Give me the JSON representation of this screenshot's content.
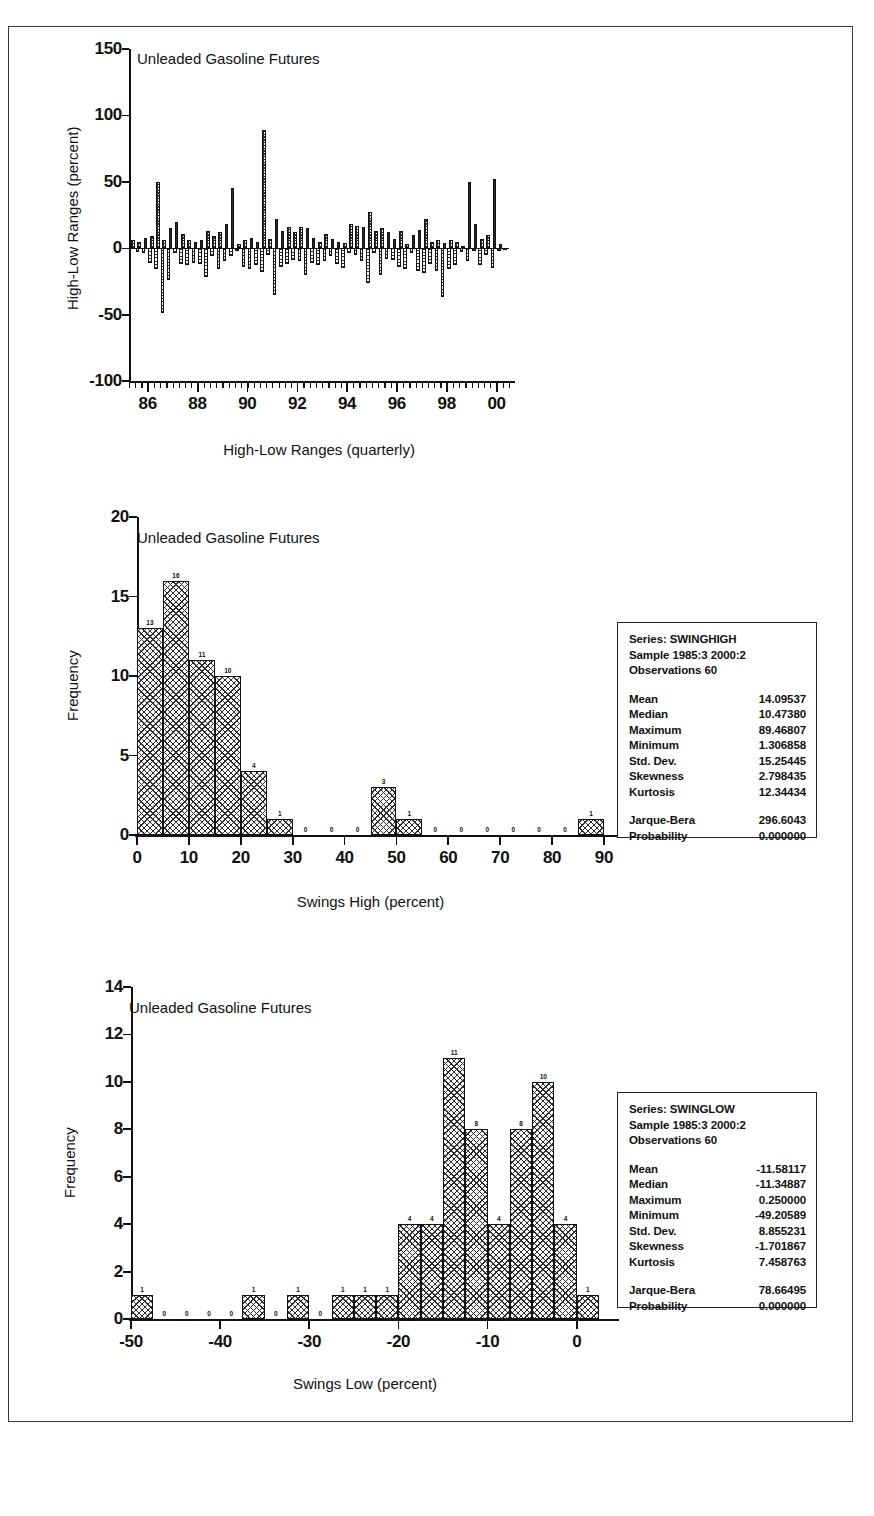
{
  "figure": {
    "border_color": "#3a3a3a",
    "background": "#ffffff"
  },
  "panel1": {
    "title": "Unleaded Gasoline Futures",
    "ylabel": "High-Low Ranges (percent)",
    "xlabel": "High-Low Ranges (quarterly)",
    "yticks": [
      "150",
      "100",
      "50",
      "0",
      "-50",
      "-100"
    ],
    "xticks": [
      "86",
      "88",
      "90",
      "92",
      "94",
      "96",
      "98",
      "00"
    ]
  },
  "panel2": {
    "title": "Unleaded Gasoline Futures",
    "ylabel": "Frequency",
    "xlabel": "Swings High (percent)",
    "yticks": [
      "20",
      "15",
      "10",
      "5",
      "0"
    ],
    "xticks": [
      "0",
      "10",
      "20",
      "30",
      "40",
      "50",
      "60",
      "70",
      "80",
      "90"
    ]
  },
  "panel3": {
    "title": "Unleaded Gasoline Futures",
    "ylabel": "Frequency",
    "xlabel": "Swings Low (percent)",
    "yticks": [
      "14",
      "12",
      "10",
      "8",
      "6",
      "4",
      "2",
      "0"
    ],
    "xticks": [
      "-50",
      "-40",
      "-30",
      "-20",
      "-10",
      "0"
    ]
  },
  "stats_high": {
    "series": "Series: SWINGHIGH",
    "sample": "Sample 1985:3 2000:2",
    "observations": "Observations 60",
    "rows": [
      {
        "key": "Mean",
        "value": "14.09537"
      },
      {
        "key": "Median",
        "value": "10.47380"
      },
      {
        "key": "Maximum",
        "value": "89.46807"
      },
      {
        "key": "Minimum",
        "value": "1.306858"
      },
      {
        "key": "Std. Dev.",
        "value": "15.25445"
      },
      {
        "key": "Skewness",
        "value": "2.798435"
      },
      {
        "key": "Kurtosis",
        "value": "12.34434"
      }
    ],
    "test_rows": [
      {
        "key": "Jarque-Bera",
        "value": "296.6043"
      },
      {
        "key": "Probability",
        "value": "0.000000"
      }
    ]
  },
  "stats_low": {
    "series": "Series: SWINGLOW",
    "sample": "Sample 1985:3 2000:2",
    "observations": "Observations 60",
    "rows": [
      {
        "key": "Mean",
        "value": "-11.58117"
      },
      {
        "key": "Median",
        "value": "-11.34887"
      },
      {
        "key": "Maximum",
        "value": "0.250000"
      },
      {
        "key": "Minimum",
        "value": "-49.20589"
      },
      {
        "key": "Std. Dev.",
        "value": "8.855231"
      },
      {
        "key": "Skewness",
        "value": "-1.701867"
      },
      {
        "key": "Kurtosis",
        "value": "7.458763"
      }
    ],
    "test_rows": [
      {
        "key": "Jarque-Bera",
        "value": "78.66495"
      },
      {
        "key": "Probability",
        "value": "0.000000"
      }
    ]
  },
  "chart_data": [
    {
      "type": "bar",
      "id": "high-low-ranges-quarterly",
      "title": "Unleaded Gasoline Futures",
      "xlabel": "High-Low Ranges (quarterly)",
      "ylabel": "High-Low Ranges (percent)",
      "ylim": [
        -100,
        150
      ],
      "xlim": [
        1985.25,
        2000.5
      ],
      "yticks": [
        -100,
        -50,
        0,
        50,
        100,
        150
      ],
      "xticks": [
        1986,
        1988,
        1990,
        1992,
        1994,
        1996,
        1998,
        2000
      ],
      "xtick_labels": [
        "86",
        "88",
        "90",
        "92",
        "94",
        "96",
        "98",
        "00"
      ],
      "grid": false,
      "legend": "none",
      "note": "Paired quarterly swing-high (positive) and swing-low (negative) percentage bars, 1985:3 through 2000:2",
      "x": [
        1985.5,
        1985.75,
        1986.0,
        1986.25,
        1986.5,
        1986.75,
        1987.0,
        1987.25,
        1987.5,
        1987.75,
        1988.0,
        1988.25,
        1988.5,
        1988.75,
        1989.0,
        1989.25,
        1989.5,
        1989.75,
        1990.0,
        1990.25,
        1990.5,
        1990.75,
        1991.0,
        1991.25,
        1991.5,
        1991.75,
        1992.0,
        1992.25,
        1992.5,
        1992.75,
        1993.0,
        1993.25,
        1993.5,
        1993.75,
        1994.0,
        1994.25,
        1994.5,
        1994.75,
        1995.0,
        1995.25,
        1995.5,
        1995.75,
        1996.0,
        1996.25,
        1996.5,
        1996.75,
        1997.0,
        1997.25,
        1997.5,
        1997.75,
        1998.0,
        1998.25,
        1998.5,
        1998.75,
        1999.0,
        1999.25,
        1999.5,
        1999.75,
        2000.0,
        2000.25
      ],
      "series": [
        {
          "name": "Swing High (percent)",
          "values": [
            6,
            5,
            8,
            9,
            50,
            6,
            15,
            20,
            11,
            6,
            5,
            6,
            13,
            9,
            12,
            18,
            45,
            3,
            6,
            8,
            5,
            89,
            7,
            22,
            13,
            16,
            12,
            16,
            15,
            8,
            5,
            11,
            7,
            5,
            4,
            18,
            17,
            16,
            27,
            13,
            15,
            12,
            7,
            13,
            3,
            10,
            14,
            22,
            5,
            6,
            4,
            6,
            5,
            2,
            50,
            18,
            7,
            10,
            52,
            3
          ]
        },
        {
          "name": "Swing Low (percent)",
          "values": [
            -3,
            -4,
            -11,
            -16,
            -49,
            -24,
            -4,
            -12,
            -13,
            -11,
            -12,
            -22,
            -6,
            -16,
            -10,
            -6,
            -2,
            -14,
            -16,
            -13,
            -18,
            -5,
            -35,
            -14,
            -12,
            -9,
            -10,
            -20,
            -11,
            -13,
            -10,
            -6,
            -12,
            -15,
            -4,
            -5,
            -10,
            -26,
            -4,
            -20,
            -8,
            -9,
            -14,
            -16,
            -4,
            -17,
            -19,
            -12,
            -17,
            -37,
            -16,
            -13,
            -3,
            -10,
            -2,
            -13,
            -5,
            -15,
            -2,
            -1
          ]
        }
      ]
    },
    {
      "type": "bar",
      "id": "swings-high-histogram",
      "title": "Unleaded Gasoline Futures",
      "xlabel": "Swings High (percent)",
      "ylabel": "Frequency",
      "ylim": [
        0,
        20
      ],
      "xlim": [
        0,
        90
      ],
      "yticks": [
        0,
        5,
        10,
        15,
        20
      ],
      "xticks": [
        0,
        10,
        20,
        30,
        40,
        50,
        60,
        70,
        80,
        90
      ],
      "grid": false,
      "legend": "none",
      "bin_width": 5,
      "bin_edges": [
        0,
        5,
        10,
        15,
        20,
        25,
        30,
        35,
        40,
        45,
        50,
        55,
        60,
        65,
        70,
        75,
        80,
        85,
        90
      ],
      "categories": [
        "0-5",
        "5-10",
        "10-15",
        "15-20",
        "20-25",
        "25-30",
        "30-35",
        "35-40",
        "40-45",
        "45-50",
        "50-55",
        "55-60",
        "60-65",
        "65-70",
        "70-75",
        "75-80",
        "80-85",
        "85-90"
      ],
      "values": [
        13,
        16,
        11,
        10,
        4,
        1,
        0,
        0,
        0,
        3,
        1,
        0,
        0,
        0,
        0,
        0,
        0,
        1
      ],
      "bar_labels": [
        "13",
        "16",
        "11",
        "10",
        "4",
        "1",
        "0",
        "0",
        "0",
        "3",
        "1",
        "0",
        "0",
        "0",
        "0",
        "0",
        "0",
        "1"
      ]
    },
    {
      "type": "bar",
      "id": "swings-low-histogram",
      "title": "Unleaded Gasoline Futures",
      "xlabel": "Swings Low (percent)",
      "ylabel": "Frequency",
      "ylim": [
        0,
        14
      ],
      "xlim": [
        -50,
        2.5
      ],
      "yticks": [
        0,
        2,
        4,
        6,
        8,
        10,
        12,
        14
      ],
      "xticks": [
        -50,
        -40,
        -30,
        -20,
        -10,
        0
      ],
      "grid": false,
      "legend": "none",
      "bin_width": 2.5,
      "bin_edges": [
        -50,
        -47.5,
        -45,
        -42.5,
        -40,
        -37.5,
        -35,
        -32.5,
        -30,
        -27.5,
        -25,
        -22.5,
        -20,
        -17.5,
        -15,
        -12.5,
        -10,
        -7.5,
        -5,
        -2.5,
        0,
        2.5
      ],
      "categories": [
        "-50 to -47.5",
        "-47.5 to -45",
        "-45 to -42.5",
        "-42.5 to -40",
        "-40 to -37.5",
        "-37.5 to -35",
        "-35 to -32.5",
        "-32.5 to -30",
        "-30 to -27.5",
        "-27.5 to -25",
        "-25 to -22.5",
        "-22.5 to -20",
        "-20 to -17.5",
        "-17.5 to -15",
        "-15 to -12.5",
        "-12.5 to -10",
        "-10 to -7.5",
        "-7.5 to -5",
        "-5 to -2.5",
        "-2.5 to 0",
        "0 to 2.5"
      ],
      "values": [
        1,
        0,
        0,
        0,
        0,
        1,
        0,
        1,
        0,
        1,
        1,
        1,
        4,
        4,
        11,
        8,
        4,
        8,
        10,
        4,
        1
      ],
      "bar_labels": [
        "1",
        "0",
        "0",
        "0",
        "0",
        "1",
        "0",
        "1",
        "0",
        "1",
        "1",
        "1",
        "4",
        "4",
        "11",
        "8",
        "4",
        "8",
        "10",
        "4",
        "1"
      ]
    }
  ]
}
